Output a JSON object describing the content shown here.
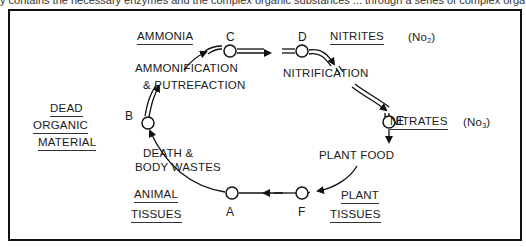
{
  "header": {
    "cut_off_text": "y contains the necessary enzymes and the complex organic substances ... through a series of complex orga"
  },
  "diagram": {
    "nodes": [
      {
        "id": "A",
        "label": "A"
      },
      {
        "id": "B",
        "label": "B"
      },
      {
        "id": "C",
        "label": "C"
      },
      {
        "id": "D",
        "label": "D"
      },
      {
        "id": "E",
        "label": "E"
      },
      {
        "id": "F",
        "label": "F"
      }
    ],
    "stages": {
      "ammonia": "AMMONIA",
      "nitrites": "NITRITES",
      "nitrites_formula": "(No",
      "nitrites_sub": "2",
      "nitrites_close": ")",
      "nitrates": "NITRATES",
      "nitrates_formula": "(No",
      "nitrates_sub": "3",
      "nitrates_close": ")",
      "dead_1": "DEAD",
      "dead_2": "ORGANIC",
      "dead_3": "MATERIAL",
      "animal_1": "ANIMAL",
      "animal_2": "TISSUES",
      "plant_1": "PLANT",
      "plant_2": "TISSUES"
    },
    "processes": {
      "ammonification_1": "AMMONIFICATION",
      "ammonification_2": "& PUTREFACTION",
      "nitrification": "NITRIFICATION",
      "plant_food": "PLANT FOOD",
      "death_1": "DEATH  &",
      "death_2": "BODY WASTES"
    },
    "edges": [
      {
        "from": "A",
        "to": "B",
        "label": "DEATH & BODY WASTES"
      },
      {
        "from": "B",
        "to": "C",
        "label": "AMMONIFICATION & PUTREFACTION"
      },
      {
        "from": "C",
        "to": "D",
        "label": ""
      },
      {
        "from": "D",
        "to": "E",
        "label": "NITRIFICATION"
      },
      {
        "from": "E",
        "to": "F",
        "label": "PLANT FOOD"
      },
      {
        "from": "F",
        "to": "A",
        "label": ""
      }
    ]
  }
}
